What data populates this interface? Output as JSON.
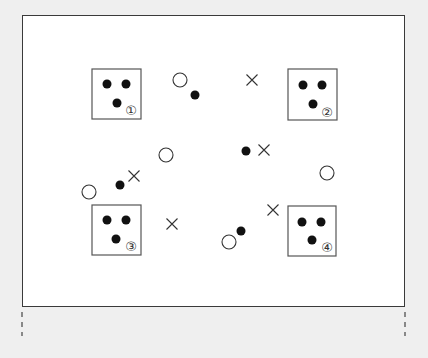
{
  "diagram": {
    "frame": {
      "x": 22,
      "y": 15,
      "width": 383,
      "height": 292
    },
    "boxes": [
      {
        "id": 1,
        "label": "①",
        "x": 92,
        "y": 69,
        "w": 49,
        "h": 50,
        "dots": [
          [
            107,
            84
          ],
          [
            126,
            84
          ],
          [
            117,
            103
          ]
        ],
        "label_pos": [
          131,
          111
        ]
      },
      {
        "id": 2,
        "label": "②",
        "x": 288,
        "y": 69,
        "w": 49,
        "h": 51,
        "dots": [
          [
            303,
            85
          ],
          [
            322,
            85
          ],
          [
            313,
            104
          ]
        ],
        "label_pos": [
          327,
          113
        ]
      },
      {
        "id": 3,
        "label": "③",
        "x": 92,
        "y": 205,
        "w": 49,
        "h": 50,
        "dots": [
          [
            107,
            220
          ],
          [
            126,
            220
          ],
          [
            116,
            239
          ]
        ],
        "label_pos": [
          131,
          247
        ]
      },
      {
        "id": 4,
        "label": "④",
        "x": 288,
        "y": 206,
        "w": 48,
        "h": 50,
        "dots": [
          [
            302,
            222
          ],
          [
            321,
            222
          ],
          [
            312,
            240
          ]
        ],
        "label_pos": [
          327,
          248
        ]
      }
    ],
    "open_circles": [
      [
        180,
        80
      ],
      [
        166,
        155
      ],
      [
        327,
        173
      ],
      [
        89,
        192
      ],
      [
        229,
        242
      ]
    ],
    "filled_dots": [
      [
        195,
        95
      ],
      [
        246,
        151
      ],
      [
        120,
        185
      ],
      [
        241,
        231
      ]
    ],
    "crosses": [
      [
        252,
        80
      ],
      [
        264,
        150
      ],
      [
        134,
        176
      ],
      [
        172,
        224
      ],
      [
        273,
        210
      ]
    ],
    "dashed_marks": [
      {
        "x": 22,
        "y1": 312,
        "y2": 336
      },
      {
        "x": 405,
        "y1": 312,
        "y2": 336
      }
    ],
    "colors": {
      "background": "#efefef",
      "frame_fill": "#ffffff",
      "ink": "#111111",
      "box_stroke": "#555555"
    }
  }
}
